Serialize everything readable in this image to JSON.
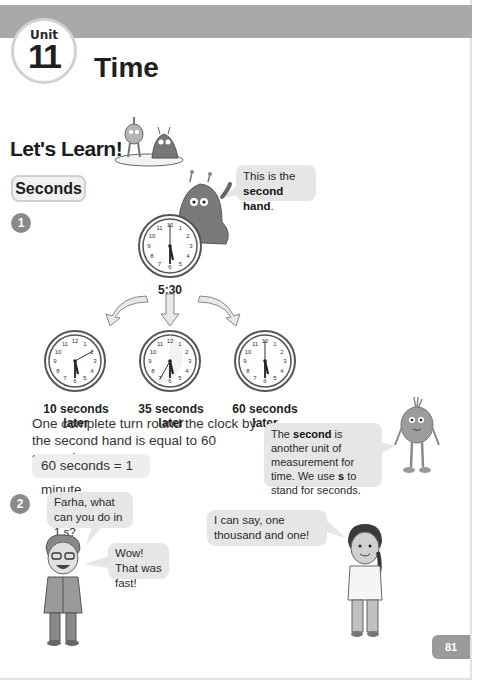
{
  "unit": {
    "label": "Unit",
    "number": "11",
    "title": "Time"
  },
  "section": {
    "heading": "Let's Learn!",
    "tag": "Seconds"
  },
  "colors": {
    "header_band": "#a9a9a9",
    "bubble_bg": "#e6e6e6",
    "step_badge": "#8a8a8a",
    "page_number_bg": "#9a9a9a"
  },
  "step1": {
    "number": "1",
    "bubble_text_prefix": "This is the",
    "bubble_text_bold": "second hand",
    "bubble_text_suffix": ".",
    "main_clock": {
      "time": "5:30",
      "hour": 5,
      "minute": 30,
      "second": 0
    },
    "clocks": [
      {
        "caption": "10 seconds later",
        "second": 10
      },
      {
        "caption": "35 seconds later",
        "second": 35
      },
      {
        "caption": "60 seconds later",
        "second": 60
      }
    ],
    "explanation": "One complete turn round the clock by the second hand is equal to 60 seconds.",
    "equation": "60 seconds = 1 minute",
    "definition": {
      "part1": "The ",
      "bold1": "second",
      "part2": " is another unit of measurement for time. We use ",
      "bold2": "s",
      "part3": " to stand for seconds."
    }
  },
  "step2": {
    "number": "2",
    "boy_bubble_question": "Farha, what can you do in 1 s?",
    "boy_bubble_reply": "Wow! That was fast!",
    "girl_bubble": "I can say, one thousand and one!"
  },
  "page_number": "81"
}
